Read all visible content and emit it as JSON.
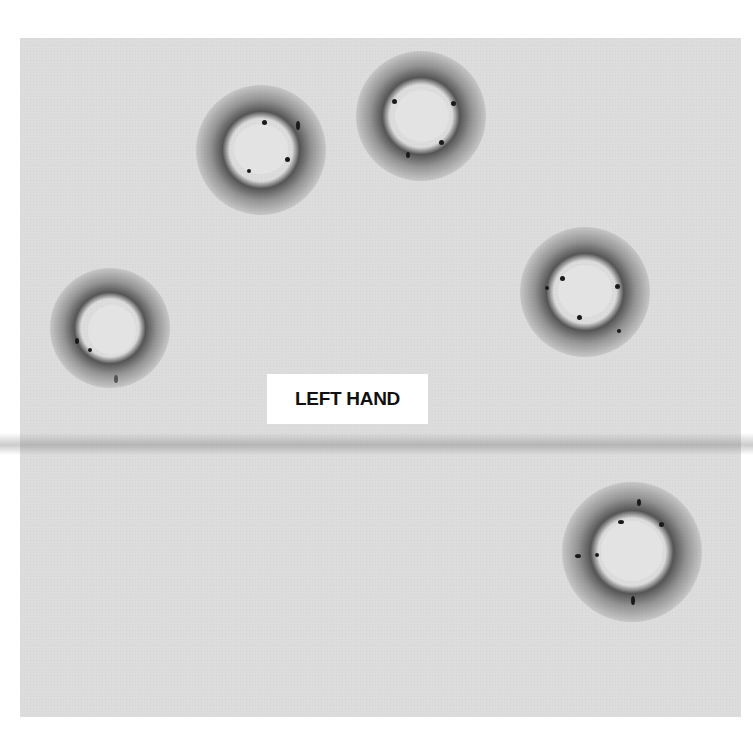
{
  "image": {
    "description": "Scanned gray paper target with five bullet holes surrounded by dark powder/soot rings and a horizontal fold line",
    "label": "LEFT HAND",
    "colors": {
      "background": "#ffffff",
      "paper": "#dcdcdc",
      "soot": "#1a1a1a",
      "label_bg": "#ffffff",
      "label_text": "#111111"
    },
    "holes": [
      {
        "name": "hole-upper-left",
        "cx": 261,
        "cy": 150,
        "r": 27
      },
      {
        "name": "hole-top-center",
        "cx": 421,
        "cy": 116,
        "r": 27
      },
      {
        "name": "hole-right",
        "cx": 585,
        "cy": 292,
        "r": 27
      },
      {
        "name": "hole-left",
        "cx": 111,
        "cy": 328,
        "r": 25
      },
      {
        "name": "hole-lower-right",
        "cx": 632,
        "cy": 552,
        "r": 31
      }
    ]
  }
}
